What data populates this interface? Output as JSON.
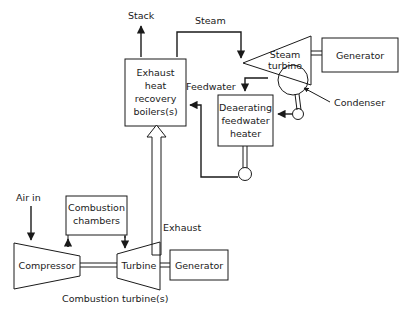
{
  "diagram": {
    "title_caption": "Combustion turbine(s)",
    "stroke_color": "#1a1a1a",
    "background_color": "#ffffff",
    "blocks": {
      "exhaust_heat_recovery_boilers": {
        "line1": "Exhaust",
        "line2": "heat",
        "line3": "recovery",
        "line4": "boilers(s)"
      },
      "deaerating_feedwater_heater": {
        "line1": "Deaerating",
        "line2": "feedwater",
        "line3": "heater"
      },
      "combustion_chambers": {
        "line1": "Combustion",
        "line2": "chambers"
      },
      "compressor": {
        "label": "Compressor"
      },
      "turbine": {
        "label": "Turbine"
      },
      "generator_bottom": {
        "label": "Generator"
      },
      "generator_top": {
        "label": "Generator"
      },
      "steam_turbine": {
        "line1": "Steam",
        "line2": "turbine"
      }
    },
    "flow_labels": {
      "stack": "Stack",
      "steam": "Steam",
      "feedwater": "Feedwater",
      "exhaust": "Exhaust",
      "air_in": "Air in",
      "condenser": "Condenser"
    }
  }
}
